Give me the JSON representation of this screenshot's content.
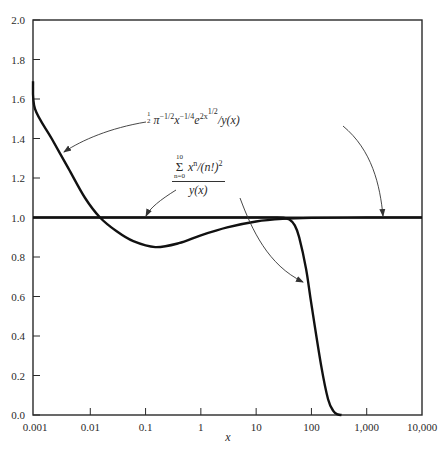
{
  "chart_data": {
    "type": "line",
    "title": "",
    "xlabel": "x",
    "ylabel": "",
    "xscale": "log",
    "xlim": [
      0.0005,
      10000
    ],
    "ylim": [
      0.0,
      2.0
    ],
    "grid": false,
    "x_ticks": [
      "0.001",
      "0.01",
      "0.1",
      "1",
      "10",
      "100",
      "1,000",
      "10,000"
    ],
    "y_ticks": [
      "0.0",
      "0.2",
      "0.4",
      "0.6",
      "0.8",
      "1.0",
      "1.2",
      "1.4",
      "1.6",
      "1.8",
      "2.0"
    ],
    "series": [
      {
        "name": "asymptotic_ratio",
        "label": "(1/2) π^(-1/2) x^(-1/4) e^(2x^(1/2)) / y(x)",
        "x": [
          0.0005,
          0.001,
          0.002,
          0.004,
          0.008,
          0.015,
          0.03,
          0.06,
          0.15,
          0.4,
          1,
          3,
          10,
          30,
          100,
          1000,
          10000
        ],
        "y": [
          1.69,
          1.55,
          1.4,
          1.25,
          1.1,
          1.0,
          0.93,
          0.88,
          0.85,
          0.87,
          0.91,
          0.95,
          0.98,
          0.993,
          0.998,
          1.0,
          1.0
        ]
      },
      {
        "name": "truncated_series_ratio",
        "label": "Σ_{n=0}^{10} x^n/(n!)^2 / y(x)",
        "x": [
          0.0005,
          0.01,
          1,
          10,
          20,
          30,
          40,
          50,
          60,
          80,
          100,
          150,
          200,
          250,
          300,
          350
        ],
        "y": [
          1.0,
          1.0,
          1.0,
          1.0,
          1.0,
          0.999,
          0.99,
          0.96,
          0.9,
          0.74,
          0.56,
          0.25,
          0.08,
          0.02,
          0.003,
          0.0
        ]
      }
    ],
    "annotations": [
      {
        "text": "½ π^(-1/2) x^(-1/4) e^(2x^(1/2)) / y(x)",
        "arrows_to": [
          "asymptotic_ratio near x≈0.002, y≈1.35",
          "y=1.0 line near x≈2000"
        ]
      },
      {
        "text": "Σ_{n=0}^{10} x^n/(n!)^2 / y(x)",
        "arrows_to": [
          "y=1.0 line near x≈0.1",
          "truncated_series_ratio near x≈70, y≈0.82"
        ]
      }
    ]
  },
  "labels": {
    "xlabel": "x",
    "ann1": {
      "half_num": "1",
      "half_den": "2",
      "pi": "π",
      "pi_exp": "−1/2",
      "x": "x",
      "x_exp": "−1/4",
      "e": "e",
      "e_exp": "2x",
      "e_exp2": "1/2",
      "tail": "/y(x)"
    },
    "ann2": {
      "sum_top": "10",
      "sum_sym": "Σ",
      "sum_bot": "n=0",
      "num_body": "x",
      "num_exp": "n",
      "num_tail": "/(n!)",
      "num_tail_exp": "2",
      "den": "y(x)"
    }
  }
}
